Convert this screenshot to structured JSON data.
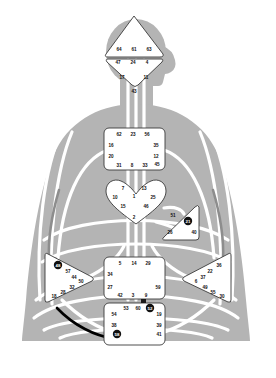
{
  "chart": {
    "type": "diagram",
    "palette": {
      "body_fill": "#b4b4b4",
      "channel_undefined": "#ffffff",
      "channel_gray": "#8d8d8d",
      "channel_black": "#000000",
      "center_fill": "#ffffff",
      "center_stroke": "#3a3a3a",
      "gate_text": "#111111",
      "defined_gate_fill": "#111111",
      "defined_gate_text": "#ffffff"
    },
    "centers": [
      {
        "name": "Head",
        "shape": "triangle",
        "defined": false,
        "gates": [
          {
            "num": "64",
            "x": 119,
            "y": 49,
            "defined": false
          },
          {
            "num": "61",
            "x": 134,
            "y": 49,
            "defined": false
          },
          {
            "num": "63",
            "x": 149,
            "y": 49,
            "defined": false
          }
        ]
      },
      {
        "name": "Ajna",
        "shape": "inverted-triangle",
        "defined": false,
        "gates": [
          {
            "num": "47",
            "x": 118,
            "y": 62,
            "defined": false
          },
          {
            "num": "24",
            "x": 133,
            "y": 62,
            "defined": false
          },
          {
            "num": "4",
            "x": 147,
            "y": 62,
            "defined": false
          },
          {
            "num": "17",
            "x": 122,
            "y": 77,
            "defined": false
          },
          {
            "num": "11",
            "x": 146,
            "y": 77,
            "defined": false
          }
        ]
      },
      {
        "name": "Throat",
        "shape": "square",
        "defined": false,
        "gates": [
          {
            "num": "43",
            "x": 134,
            "y": 91,
            "defined": false
          },
          {
            "num": "62",
            "x": 119,
            "y": 134,
            "defined": false
          },
          {
            "num": "23",
            "x": 133,
            "y": 134,
            "defined": false
          },
          {
            "num": "56",
            "x": 147,
            "y": 134,
            "defined": false
          },
          {
            "num": "16",
            "x": 111,
            "y": 145,
            "defined": false
          },
          {
            "num": "35",
            "x": 156,
            "y": 145,
            "defined": false
          },
          {
            "num": "20",
            "x": 111,
            "y": 156,
            "defined": false
          },
          {
            "num": "12",
            "x": 156,
            "y": 156,
            "defined": false
          },
          {
            "num": "31",
            "x": 119,
            "y": 165,
            "defined": false
          },
          {
            "num": "8",
            "x": 132,
            "y": 165,
            "defined": false
          },
          {
            "num": "33",
            "x": 145,
            "y": 165,
            "defined": false
          },
          {
            "num": "45",
            "x": 157,
            "y": 164,
            "defined": false
          }
        ]
      },
      {
        "name": "G Center",
        "shape": "diamond-heart",
        "defined": false,
        "gates": [
          {
            "num": "7",
            "x": 123,
            "y": 188,
            "defined": false
          },
          {
            "num": "13",
            "x": 144,
            "y": 188,
            "defined": false
          },
          {
            "num": "1",
            "x": 134,
            "y": 196,
            "defined": false
          },
          {
            "num": "10",
            "x": 115,
            "y": 197,
            "defined": false
          },
          {
            "num": "25",
            "x": 153,
            "y": 197,
            "defined": false
          },
          {
            "num": "15",
            "x": 123,
            "y": 206,
            "defined": false
          },
          {
            "num": "46",
            "x": 146,
            "y": 206,
            "defined": false
          },
          {
            "num": "2",
            "x": 134,
            "y": 217,
            "defined": false
          }
        ]
      },
      {
        "name": "Ego / Heart",
        "shape": "triangle-right",
        "defined": true,
        "gates": [
          {
            "num": "51",
            "x": 173,
            "y": 215,
            "defined": false
          },
          {
            "num": "21",
            "x": 188,
            "y": 221,
            "defined": true
          },
          {
            "num": "26",
            "x": 170,
            "y": 232,
            "defined": false
          },
          {
            "num": "40",
            "x": 194,
            "y": 232,
            "defined": false
          }
        ]
      },
      {
        "name": "Spleen",
        "shape": "triangle-left",
        "defined": true,
        "gates": [
          {
            "num": "48",
            "x": 58,
            "y": 265,
            "defined": true
          },
          {
            "num": "57",
            "x": 68,
            "y": 271,
            "defined": false
          },
          {
            "num": "44",
            "x": 74,
            "y": 277,
            "defined": false
          },
          {
            "num": "50",
            "x": 81,
            "y": 281,
            "defined": false
          },
          {
            "num": "32",
            "x": 72,
            "y": 287,
            "defined": false
          },
          {
            "num": "28",
            "x": 63,
            "y": 292,
            "defined": false
          },
          {
            "num": "18",
            "x": 54,
            "y": 296,
            "defined": false
          }
        ]
      },
      {
        "name": "Solar Plexus",
        "shape": "triangle-right",
        "defined": false,
        "gates": [
          {
            "num": "36",
            "x": 219,
            "y": 265,
            "defined": false
          },
          {
            "num": "22",
            "x": 210,
            "y": 271,
            "defined": false
          },
          {
            "num": "37",
            "x": 203,
            "y": 277,
            "defined": false
          },
          {
            "num": "6",
            "x": 196,
            "y": 281,
            "defined": false
          },
          {
            "num": "49",
            "x": 205,
            "y": 287,
            "defined": false
          },
          {
            "num": "55",
            "x": 213,
            "y": 292,
            "defined": false
          },
          {
            "num": "30",
            "x": 222,
            "y": 296,
            "defined": false
          }
        ]
      },
      {
        "name": "Sacral",
        "shape": "square",
        "defined": false,
        "gates": [
          {
            "num": "5",
            "x": 120,
            "y": 263,
            "defined": false
          },
          {
            "num": "14",
            "x": 134,
            "y": 263,
            "defined": false
          },
          {
            "num": "29",
            "x": 148,
            "y": 263,
            "defined": false
          },
          {
            "num": "34",
            "x": 110,
            "y": 274,
            "defined": false
          },
          {
            "num": "27",
            "x": 110,
            "y": 287,
            "defined": false
          },
          {
            "num": "59",
            "x": 158,
            "y": 287,
            "defined": false
          },
          {
            "num": "42",
            "x": 120,
            "y": 295,
            "defined": false
          },
          {
            "num": "3",
            "x": 133,
            "y": 295,
            "defined": false
          },
          {
            "num": "9",
            "x": 146,
            "y": 295,
            "defined": false
          }
        ]
      },
      {
        "name": "Root",
        "shape": "square",
        "defined": true,
        "gates": [
          {
            "num": "53",
            "x": 126,
            "y": 308,
            "defined": false
          },
          {
            "num": "60",
            "x": 138,
            "y": 308,
            "defined": false
          },
          {
            "num": "52",
            "x": 150,
            "y": 308,
            "defined": true
          },
          {
            "num": "54",
            "x": 114,
            "y": 314,
            "defined": false
          },
          {
            "num": "19",
            "x": 159,
            "y": 314,
            "defined": false
          },
          {
            "num": "38",
            "x": 114,
            "y": 325,
            "defined": false
          },
          {
            "num": "39",
            "x": 159,
            "y": 325,
            "defined": false
          },
          {
            "num": "58",
            "x": 117,
            "y": 334,
            "defined": true
          },
          {
            "num": "41",
            "x": 159,
            "y": 334,
            "defined": false
          }
        ]
      }
    ],
    "defined_gates": [
      "21",
      "48",
      "52",
      "58"
    ],
    "channels": [
      {
        "name": "18-58",
        "style": "black",
        "defined": true
      },
      {
        "name": "left-torso-arc",
        "style": "gray",
        "defined": false
      },
      {
        "name": "right-torso-arc",
        "style": "gray",
        "defined": false
      }
    ]
  }
}
